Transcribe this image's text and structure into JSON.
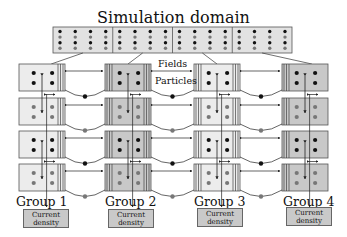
{
  "title": "Simulation domain",
  "labels": {
    "fields": "Fields",
    "particles": "Particles"
  },
  "groups": [
    {
      "label": "Group 1",
      "output": "Current density",
      "output_lines": [
        "Current",
        "density"
      ],
      "shaded": false
    },
    {
      "label": "Group 2",
      "output": "Current density",
      "output_lines": [
        "Current",
        "density"
      ],
      "shaded": true
    },
    {
      "label": "Group 3",
      "output": "Current density",
      "output_lines": [
        "Current",
        "density"
      ],
      "shaded": false
    },
    {
      "label": "Group 4",
      "output": "Current density",
      "output_lines": [
        "Current",
        "density"
      ],
      "shaded": true
    }
  ],
  "colors": {
    "light_fill": "#ececec",
    "dark_fill": "#c8c8c8",
    "domain_fill": "#e2e2e2",
    "stroke": "#555555",
    "particle_black": "#111111",
    "particle_gray": "#777777"
  },
  "geometry": {
    "domain": {
      "x": 53,
      "y": 27,
      "w": 239,
      "h": 26,
      "segments": 4,
      "cols_per_segment": 4,
      "dots_per_col": 4
    },
    "block_x": [
      19,
      105,
      194,
      282
    ],
    "block_w": 46,
    "row_y": [
      64,
      98,
      131,
      164
    ],
    "block_h": 27
  }
}
